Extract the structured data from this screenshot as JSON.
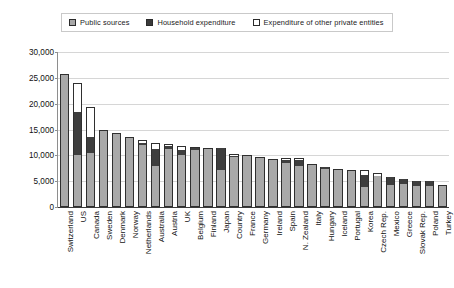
{
  "legend": {
    "items": [
      {
        "label": "Public sources",
        "swatch": "filled-gray-square-icon",
        "color": "#a8a8a8"
      },
      {
        "label": "Household expenditure",
        "swatch": "filled-dark-square-icon",
        "color": "#3a3a3a"
      },
      {
        "label": "Expenditure of other private entities",
        "swatch": "empty-square-icon",
        "color": "#ffffff"
      }
    ]
  },
  "axis": {
    "y_ticks": [
      "0",
      "5,000",
      "10,000",
      "15,000",
      "20,000",
      "25,000",
      "30,000"
    ]
  },
  "chart_data": {
    "type": "bar",
    "subtype": "stacked-vertical",
    "title": "",
    "xlabel": "",
    "ylabel": "",
    "ylim": [
      0,
      30000
    ],
    "ytick_step": 5000,
    "grid": true,
    "legend_position": "top",
    "categories": [
      "Switzerland",
      "US",
      "Canada",
      "Sweden",
      "Denmark",
      "Norway",
      "Netherlands",
      "Australia",
      "Austria",
      "UK",
      "Belgium",
      "Finland",
      "Japan",
      "Country",
      "France",
      "Germany",
      "Ireland",
      "Spain",
      "N. Zealand",
      "Italy",
      "Hungary",
      "Iceland",
      "Portugal",
      "Korea",
      "Czech Rep.",
      "Mexico",
      "Greece",
      "Slovak Rep.",
      "Poland",
      "Turkey"
    ],
    "series": [
      {
        "name": "Public sources",
        "color": "#a9a9a9",
        "values": [
          25800,
          10100,
          10400,
          15000,
          14300,
          13600,
          12000,
          7900,
          11300,
          10000,
          11000,
          11500,
          7200,
          9700,
          10000,
          9600,
          9300,
          8600,
          7900,
          8400,
          7400,
          7400,
          7200,
          3900,
          6000,
          4300,
          4500,
          4100,
          4100,
          4200
        ]
      },
      {
        "name": "Household expenditure",
        "color": "#3e3e3e",
        "values": [
          0,
          8200,
          3100,
          0,
          0,
          0,
          300,
          3400,
          500,
          1000,
          400,
          0,
          4300,
          200,
          0,
          0,
          0,
          500,
          1200,
          0,
          300,
          0,
          0,
          2300,
          0,
          1500,
          900,
          900,
          900,
          0
        ]
      },
      {
        "name": "Expenditure of other private entities",
        "color": "#ffffff",
        "values": [
          0,
          5700,
          5900,
          0,
          0,
          0,
          700,
          1000,
          400,
          800,
          200,
          0,
          0,
          300,
          0,
          0,
          0,
          300,
          400,
          0,
          0,
          0,
          0,
          1000,
          500,
          0,
          0,
          0,
          0,
          0
        ]
      }
    ]
  }
}
